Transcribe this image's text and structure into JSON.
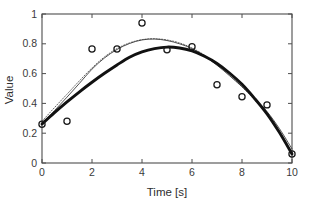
{
  "chart_data": {
    "type": "scatter",
    "title": "",
    "xlabel": "Time [s]",
    "ylabel": "Value",
    "xlim": [
      0,
      10
    ],
    "ylim": [
      0,
      1
    ],
    "xticks": [
      "0",
      "2",
      "4",
      "6",
      "8",
      "10"
    ],
    "xtick_values": [
      0,
      2,
      4,
      6,
      8,
      10
    ],
    "yticks": [
      "0",
      "0.2",
      "0.4",
      "0.6",
      "0.8",
      "1"
    ],
    "ytick_values": [
      0,
      0.2,
      0.4,
      0.6,
      0.8,
      1
    ],
    "grid": false,
    "legend": null,
    "legend_position": "none",
    "marker_style": "open-circle",
    "series": [
      {
        "name": "data points",
        "type": "scatter",
        "marker": "open-circle",
        "color": "#1a1a1a",
        "x": [
          0,
          1,
          2,
          3,
          4,
          5,
          6,
          7,
          8,
          9,
          10
        ],
        "values": [
          0.26,
          0.28,
          0.765,
          0.765,
          0.94,
          0.76,
          0.78,
          0.525,
          0.445,
          0.39,
          0.06
        ]
      },
      {
        "name": "quadratic fit",
        "type": "line",
        "style": "solid-thick",
        "color": "#111111",
        "x": [
          0,
          0.5,
          1,
          1.5,
          2,
          2.5,
          3,
          3.5,
          4,
          4.5,
          5,
          5.5,
          6,
          6.5,
          7,
          7.5,
          8,
          8.5,
          9,
          9.5,
          10
        ],
        "values": [
          0.262,
          0.338,
          0.41,
          0.478,
          0.542,
          0.602,
          0.658,
          0.71,
          0.746,
          0.768,
          0.778,
          0.772,
          0.752,
          0.716,
          0.668,
          0.604,
          0.528,
          0.434,
          0.33,
          0.204,
          0.06
        ]
      },
      {
        "name": "spline fit",
        "type": "line",
        "style": "solid-thin",
        "color": "#333333",
        "x": [
          0,
          0.5,
          1,
          1.5,
          2,
          2.5,
          3,
          3.5,
          4,
          4.5,
          5,
          5.5,
          6,
          6.5,
          7,
          7.5,
          8,
          8.5,
          9,
          9.5,
          10
        ],
        "values": [
          0.262,
          0.352,
          0.442,
          0.535,
          0.63,
          0.705,
          0.762,
          0.802,
          0.826,
          0.832,
          0.822,
          0.8,
          0.768,
          0.718,
          0.656,
          0.586,
          0.512,
          0.432,
          0.345,
          0.23,
          0.095
        ]
      },
      {
        "name": "alternate fit",
        "type": "line",
        "style": "dotted",
        "color": "#555555",
        "x": [
          0,
          0.5,
          1,
          1.5,
          2,
          2.5,
          3,
          3.5,
          4,
          4.5,
          5,
          5.5,
          6,
          6.5,
          7,
          7.5,
          8,
          8.5,
          9,
          9.5,
          10
        ],
        "values": [
          0.28,
          0.372,
          0.462,
          0.552,
          0.638,
          0.712,
          0.768,
          0.806,
          0.828,
          0.834,
          0.826,
          0.806,
          0.772,
          0.724,
          0.662,
          0.59,
          0.51,
          0.424,
          0.33,
          0.212,
          0.07
        ]
      }
    ]
  },
  "figure": {
    "background": "#ffffff",
    "axis_color": "#4d4d4d",
    "plot_box": {
      "left": 42,
      "top": 14,
      "right": 292,
      "bottom": 163
    }
  }
}
